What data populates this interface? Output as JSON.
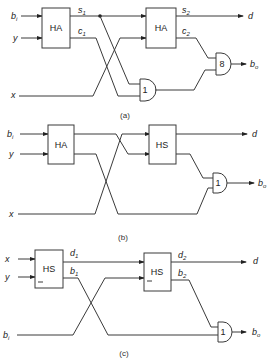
{
  "figure": {
    "panels": [
      {
        "caption": "(a)",
        "inputs": [
          "b",
          "y",
          "x"
        ],
        "input_subscripts": [
          "i",
          "",
          ""
        ],
        "block1": "HA",
        "block2": "HA",
        "block1_outputs": [
          "s",
          "c"
        ],
        "block1_output_subs": [
          "1",
          "1"
        ],
        "block2_outputs": [
          "s",
          "c"
        ],
        "block2_output_subs": [
          "2",
          "2"
        ],
        "gate1": "1",
        "gate2": "8",
        "outputs": [
          "d",
          "b"
        ],
        "output_subs": [
          "",
          "o"
        ]
      },
      {
        "caption": "(b)",
        "inputs": [
          "b",
          "y",
          "x"
        ],
        "input_subscripts": [
          "i",
          "",
          ""
        ],
        "block1": "HA",
        "block2": "HS",
        "gate1": "1",
        "outputs": [
          "d",
          "b"
        ],
        "output_subs": [
          "",
          "o"
        ]
      },
      {
        "caption": "(c)",
        "inputs": [
          "x",
          "y",
          "b"
        ],
        "input_subscripts": [
          "",
          "",
          "i"
        ],
        "block1": "HS",
        "block2": "HS",
        "block1_outputs": [
          "d",
          "b"
        ],
        "block1_output_subs": [
          "1",
          "1"
        ],
        "block2_outputs": [
          "d",
          "b"
        ],
        "block2_output_subs": [
          "2",
          "2"
        ],
        "gate1": "1",
        "outputs": [
          "d",
          "b"
        ],
        "output_subs": [
          "",
          "o"
        ]
      }
    ]
  }
}
